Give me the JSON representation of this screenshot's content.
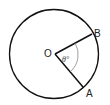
{
  "diagram": {
    "type": "circle-sector",
    "center": {
      "label": "O",
      "x": 55,
      "y": 54
    },
    "radius": 44,
    "points": [
      {
        "label": "B",
        "x": 92,
        "y": 34
      },
      {
        "label": "A",
        "x": 83,
        "y": 87
      }
    ],
    "angle": {
      "label": "θ°",
      "vertex": "O",
      "between": [
        "A",
        "B"
      ]
    },
    "colors": {
      "stroke": "#111111",
      "arc": "#888888",
      "background": "#ffffff"
    }
  }
}
